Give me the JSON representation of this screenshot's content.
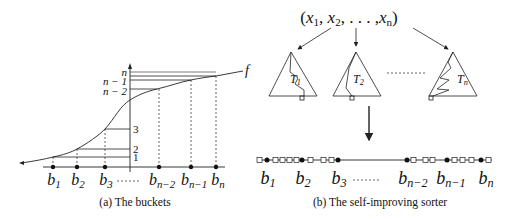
{
  "panel_a": {
    "caption": "(a) The buckets",
    "function_label": "f",
    "y_ticks": [
      {
        "label": "n",
        "y": 72
      },
      {
        "label": "n − 1",
        "y": 81
      },
      {
        "label": "n − 2",
        "y": 91
      },
      {
        "label": "3",
        "y": 129
      },
      {
        "label": "2",
        "y": 150
      },
      {
        "label": "1",
        "y": 157
      }
    ],
    "x_labels": [
      {
        "base": "b",
        "sub": "1"
      },
      {
        "base": "b",
        "sub": "2"
      },
      {
        "base": "b",
        "sub": "3"
      },
      {
        "base": "",
        "sub": "------"
      },
      {
        "base": "b",
        "sub": "n−2"
      },
      {
        "base": "b",
        "sub": "n−1"
      },
      {
        "base": "b",
        "sub": "n"
      }
    ],
    "ellipsis": "------"
  },
  "panel_b": {
    "caption": "(b) The self-improving sorter",
    "input_tuple": "(x1, x2, . . . , xn)",
    "input_tuple_parts": {
      "open": "(",
      "x1": "x",
      "s1": "1",
      "x2": "x",
      "s2": "2",
      "dots": ", . . . ,",
      "xn": "x",
      "sn": "n",
      "close": ")"
    },
    "trees": [
      {
        "label": "T",
        "sub": "1"
      },
      {
        "label": "T",
        "sub": "2"
      },
      {
        "label": "T",
        "sub": "n"
      }
    ],
    "tree_ellipsis": "---------",
    "buckets": [
      {
        "base": "b",
        "sub": "1"
      },
      {
        "base": "b",
        "sub": "2"
      },
      {
        "base": "b",
        "sub": "3"
      },
      {
        "base": "b",
        "sub": "n−2"
      },
      {
        "base": "b",
        "sub": "n−1"
      },
      {
        "base": "b",
        "sub": "n"
      }
    ],
    "bucket_ellipsis": "------"
  }
}
